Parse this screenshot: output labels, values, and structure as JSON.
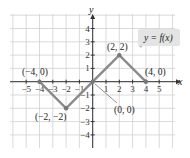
{
  "chart_data": {
    "type": "line",
    "title": "",
    "legend": "y = f(x)",
    "xlabel": "x",
    "ylabel": "y",
    "xlim": [
      -5,
      5
    ],
    "ylim": [
      -4,
      4
    ],
    "grid": true,
    "x_ticks": [
      "−5",
      "−4",
      "−3",
      "−2",
      "−1",
      "1",
      "2",
      "3",
      "4",
      "5"
    ],
    "y_ticks": [
      "4",
      "3",
      "2",
      "1",
      "−1",
      "−2",
      "−3",
      "−4"
    ],
    "series": [
      {
        "name": "y = f(x)",
        "x": [
          -4,
          -2,
          0,
          2,
          4
        ],
        "y": [
          0,
          -2,
          0,
          2,
          0
        ]
      }
    ],
    "annotations": [
      {
        "text": "(−4, 0)",
        "x": -4,
        "y": 0
      },
      {
        "text": "(−2, −2)",
        "x": -2,
        "y": -2
      },
      {
        "text": "(0, 0)",
        "x": 0,
        "y": 0
      },
      {
        "text": "(2, 2)",
        "x": 2,
        "y": 2
      },
      {
        "text": "(4, 0)",
        "x": 4,
        "y": 0
      }
    ]
  }
}
